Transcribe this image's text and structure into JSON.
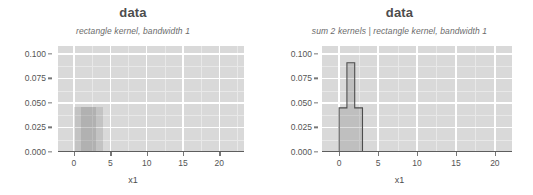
{
  "figure": {
    "width": 533,
    "height": 195,
    "background": "#ffffff",
    "panel_background": "#d9d9d9",
    "gridline_color": "#ffffff",
    "mark_color": "#8c8c8c",
    "outline_color": "#4d4d4d"
  },
  "panels": [
    {
      "id": "left",
      "title": "data",
      "subtitle": "rectangle kernel, bandwidth 1",
      "xlabel": "x1",
      "ylabel": "",
      "y_ticks": [
        "0.000",
        "0.025",
        "0.050",
        "0.075",
        "0.100"
      ],
      "x_ticks": [
        "0",
        "5",
        "10",
        "15",
        "20"
      ]
    },
    {
      "id": "right",
      "title": "data",
      "subtitle": "sum 2 kernels | rectangle kernel, bandwidth 1",
      "xlabel": "x1",
      "ylabel": "",
      "y_ticks": [
        "0.000",
        "0.025",
        "0.050",
        "0.075",
        "0.100"
      ],
      "x_ticks": [
        "0",
        "5",
        "10",
        "15",
        "20"
      ]
    }
  ],
  "chart_data": [
    {
      "type": "area",
      "panel": "left",
      "title": "data",
      "subtitle": "rectangle kernel, bandwidth 1",
      "xlabel": "x1",
      "ylabel": "",
      "xlim": [
        -2.2,
        23.4
      ],
      "ylim": [
        0.0,
        0.108
      ],
      "y_ticks": [
        0.0,
        0.025,
        0.05,
        0.075,
        0.1
      ],
      "x_ticks": [
        0,
        5,
        10,
        15,
        20
      ],
      "grid": true,
      "legend": "none",
      "series": [
        {
          "name": "individual rectangle kernels",
          "note": "overlapping semi-transparent rectangles, one per datum in the first cluster; each spans datum +/- 1 with height 0.0227",
          "kernels": [
            {
              "center": 1,
              "x0": 0,
              "x1": 2,
              "height": 0.0227
            },
            {
              "center": 2,
              "x0": 1,
              "x1": 3,
              "height": 0.0227
            },
            {
              "center": 3,
              "x0": 2,
              "x1": 4,
              "height": 0.0227
            }
          ],
          "visible_envelope_x": [
            0,
            3
          ],
          "visible_envelope_height": 0.045
        },
        {
          "name": "rug (data points)",
          "values": [
            1,
            2,
            3,
            4,
            8,
            9,
            16,
            17,
            18,
            19,
            20
          ],
          "y": 0.0
        }
      ]
    },
    {
      "type": "area",
      "panel": "right",
      "title": "data",
      "subtitle": "sum 2 kernels | rectangle kernel, bandwidth 1",
      "xlabel": "x1",
      "ylabel": "",
      "xlim": [
        -2.2,
        22.2
      ],
      "ylim": [
        0.0,
        0.108
      ],
      "y_ticks": [
        0.0,
        0.025,
        0.05,
        0.075,
        0.1
      ],
      "x_ticks": [
        0,
        5,
        10,
        15,
        20
      ],
      "grid": true,
      "legend": "none",
      "series": [
        {
          "name": "sum of 2 rectangle kernels",
          "note": "step function: plateau 0.045 from 0 to 1, spike 0.091 from 1 to 2, plateau 0.045 from 2 to 3",
          "steps": [
            {
              "x0": 0,
              "x1": 1,
              "y": 0.045
            },
            {
              "x0": 1,
              "x1": 2,
              "y": 0.091
            },
            {
              "x0": 2,
              "x1": 3,
              "y": 0.045
            }
          ]
        },
        {
          "name": "rug (data points)",
          "values": [
            1,
            2,
            3,
            4,
            8,
            9,
            16,
            17,
            18,
            19,
            20
          ],
          "y": 0.0
        }
      ]
    }
  ]
}
